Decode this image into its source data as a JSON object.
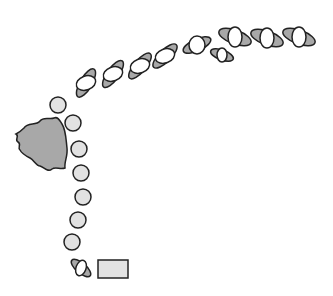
{
  "diagram": {
    "width": 333,
    "height": 296,
    "colors": {
      "background": "#ffffff",
      "stroke": "#222222",
      "dark_fill": "#a8a8a8",
      "light_fill": "#e2e2e2",
      "white_fill": "#ffffff"
    },
    "blob": {
      "name": "irregular-gray-mass",
      "path": "M24,128 C28,122 36,126 40,121 C44,116 50,120 54,118 C58,116 60,121 62,124 C66,130 66,140 67,148 C68,156 64,162 65,168 C60,170 56,166 52,169 C48,173 44,167 40,166 C36,166 34,160 30,158 C26,156 22,154 20,150 C17,148 22,144 18,142 C14,140 20,136 16,134 C20,132 22,130 24,128 Z"
    },
    "circles": [
      {
        "cx": 58,
        "cy": 105,
        "r": 8
      },
      {
        "cx": 73,
        "cy": 123,
        "r": 8
      },
      {
        "cx": 79,
        "cy": 149,
        "r": 8
      },
      {
        "cx": 81,
        "cy": 173,
        "r": 8
      },
      {
        "cx": 83,
        "cy": 197,
        "r": 8
      },
      {
        "cx": 78,
        "cy": 220,
        "r": 8
      },
      {
        "cx": 72,
        "cy": 242,
        "r": 8
      }
    ],
    "pairs": [
      {
        "cx": 86,
        "cy": 83,
        "g_rx": 16,
        "g_ry": 6,
        "g_rot": -60,
        "w_rx": 10,
        "w_ry": 7,
        "w_rot": -20
      },
      {
        "cx": 113,
        "cy": 74,
        "g_rx": 16,
        "g_ry": 6,
        "g_rot": -55,
        "w_rx": 10,
        "w_ry": 7,
        "w_rot": -20
      },
      {
        "cx": 140,
        "cy": 66,
        "g_rx": 16,
        "g_ry": 6,
        "g_rot": -50,
        "w_rx": 10,
        "w_ry": 7,
        "w_rot": -20
      },
      {
        "cx": 165,
        "cy": 56,
        "g_rx": 16,
        "g_ry": 6,
        "g_rot": -45,
        "w_rx": 10,
        "w_ry": 7,
        "w_rot": -20
      },
      {
        "cx": 197,
        "cy": 45,
        "g_rx": 15,
        "g_ry": 6,
        "g_rot": -25,
        "w_rx": 8,
        "w_ry": 9,
        "w_rot": 0
      },
      {
        "cx": 222,
        "cy": 55,
        "g_rx": 12,
        "g_ry": 5,
        "g_rot": 20,
        "w_rx": 5,
        "w_ry": 7,
        "w_rot": 0
      },
      {
        "cx": 235,
        "cy": 37,
        "g_rx": 17,
        "g_ry": 7,
        "g_rot": 20,
        "w_rx": 7,
        "w_ry": 10,
        "w_rot": 0
      },
      {
        "cx": 267,
        "cy": 38,
        "g_rx": 17,
        "g_ry": 7,
        "g_rot": 20,
        "w_rx": 7,
        "w_ry": 10,
        "w_rot": 0
      },
      {
        "cx": 299,
        "cy": 37,
        "g_rx": 17,
        "g_ry": 7,
        "g_rot": 20,
        "w_rx": 7,
        "w_ry": 10,
        "w_rot": 0
      },
      {
        "cx": 81,
        "cy": 268,
        "g_rx": 12,
        "g_ry": 5,
        "g_rot": 40,
        "w_rx": 5,
        "w_ry": 8,
        "w_rot": 20
      }
    ],
    "rectangle": {
      "x": 98,
      "y": 260,
      "width": 30,
      "height": 18
    }
  }
}
